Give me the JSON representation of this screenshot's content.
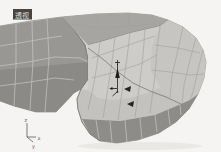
{
  "viewport": {
    "label": "透视"
  },
  "axis_tripod": {
    "x": "x",
    "y": "y",
    "z": "z"
  },
  "icons": {
    "move_gizmo_arrow": "↑",
    "gizmo_axis_cross": "+",
    "annotation_arrow": "◄"
  },
  "colors": {
    "background": "#f5f4f2",
    "face_light": "#d2d1ce",
    "face_hood": "#cdccc9",
    "face_medium": "#b0afac",
    "face_windshield": "#a6a5a2",
    "face_panel_dark": "#989793",
    "face_band_dark": "#8d8c89",
    "wireframe_light": "#c6c5c2",
    "wireframe_dark": "#7a7976",
    "gizmo": "#1c1c1c",
    "annotation": "#242424",
    "label_bg": "#454541",
    "label_text": "#dcdcd8"
  }
}
